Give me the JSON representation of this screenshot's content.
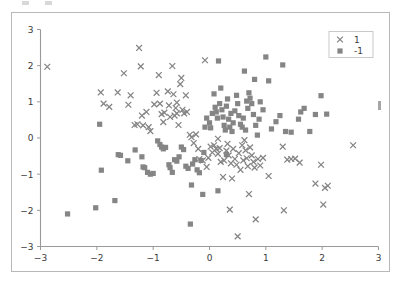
{
  "chart_data": {
    "type": "scatter",
    "title": "",
    "xlabel": "",
    "ylabel": "",
    "xlim": [
      -3,
      3
    ],
    "ylim": [
      -3,
      3
    ],
    "xticks": [
      -3,
      -2,
      -1,
      0,
      1,
      2,
      3
    ],
    "yticks": [
      -3,
      -2,
      -1,
      0,
      1,
      2,
      3
    ],
    "xtick_labels": [
      "−3",
      "−2",
      "−1",
      "0",
      "1",
      "2",
      "3"
    ],
    "ytick_labels": [
      "−3",
      "−2",
      "−1",
      "0",
      "1",
      "2",
      "3"
    ],
    "grid": false,
    "legend_position": "upper right",
    "marker_color": "#858585",
    "series": [
      {
        "name": "1",
        "marker": "x",
        "color": "#848484",
        "points": [
          [
            -2.88,
            1.97
          ],
          [
            -1.93,
            1.26
          ],
          [
            -1.88,
            0.95
          ],
          [
            -1.78,
            0.86
          ],
          [
            -1.63,
            1.26
          ],
          [
            -1.52,
            1.79
          ],
          [
            -1.44,
            0.92
          ],
          [
            -1.4,
            1.18
          ],
          [
            -1.33,
            0.36
          ],
          [
            -1.28,
            0.38
          ],
          [
            -1.25,
            2.49
          ],
          [
            -1.22,
            1.98
          ],
          [
            -1.2,
            0.62
          ],
          [
            -1.18,
            0.35
          ],
          [
            -1.12,
            0.72
          ],
          [
            -1.08,
            0.3
          ],
          [
            -1.05,
            0.19
          ],
          [
            -0.98,
            0.93
          ],
          [
            -0.94,
            1.25
          ],
          [
            -0.9,
            1.74
          ],
          [
            -0.88,
            0.95
          ],
          [
            -0.85,
            0.66
          ],
          [
            -0.82,
            0.44
          ],
          [
            -0.8,
            0.7
          ],
          [
            -0.74,
            1.29
          ],
          [
            -0.72,
            0.9
          ],
          [
            -0.7,
            0.58
          ],
          [
            -0.66,
            1.99
          ],
          [
            -0.64,
            1.21
          ],
          [
            -0.6,
            0.83
          ],
          [
            -0.58,
            0.68
          ],
          [
            -0.55,
            0.36
          ],
          [
            -0.52,
            1.49
          ],
          [
            -0.5,
            1.66
          ],
          [
            -0.48,
            0.78
          ],
          [
            -0.45,
            0.68
          ],
          [
            -0.42,
            1.18
          ],
          [
            -0.4,
            0.72
          ],
          [
            -0.35,
            0.09
          ],
          [
            -0.32,
            0.02
          ],
          [
            -0.28,
            -0.14
          ],
          [
            -0.24,
            0.1
          ],
          [
            -0.2,
            -0.3
          ],
          [
            -0.18,
            -0.58
          ],
          [
            -0.12,
            -0.62
          ],
          [
            -0.08,
            2.15
          ],
          [
            -0.05,
            -0.8
          ],
          [
            -0.02,
            -0.55
          ],
          [
            0.02,
            -0.24
          ],
          [
            0.05,
            -0.4
          ],
          [
            0.08,
            -0.2
          ],
          [
            0.12,
            -0.3
          ],
          [
            0.15,
            -0.44
          ],
          [
            0.18,
            -0.28
          ],
          [
            0.2,
            -0.66
          ],
          [
            0.24,
            -1.08
          ],
          [
            0.26,
            -0.62
          ],
          [
            0.3,
            -0.35
          ],
          [
            0.32,
            -0.16
          ],
          [
            0.34,
            -0.48
          ],
          [
            0.36,
            -1.98
          ],
          [
            0.38,
            -0.7
          ],
          [
            0.4,
            -1.12
          ],
          [
            0.42,
            -0.3
          ],
          [
            0.45,
            -0.58
          ],
          [
            0.48,
            -0.74
          ],
          [
            0.5,
            -2.72
          ],
          [
            0.52,
            -0.42
          ],
          [
            0.55,
            -0.88
          ],
          [
            0.58,
            -0.2
          ],
          [
            0.6,
            -0.62
          ],
          [
            0.62,
            -0.06
          ],
          [
            0.64,
            -0.34
          ],
          [
            0.66,
            -0.56
          ],
          [
            0.68,
            -0.78
          ],
          [
            0.7,
            -1.55
          ],
          [
            0.72,
            -0.26
          ],
          [
            0.75,
            -0.48
          ],
          [
            0.78,
            -0.66
          ],
          [
            0.8,
            -0.82
          ],
          [
            0.82,
            -2.25
          ],
          [
            0.86,
            -0.58
          ],
          [
            0.9,
            -0.76
          ],
          [
            0.95,
            -0.55
          ],
          [
            1.05,
            -1.05
          ],
          [
            1.3,
            -0.24
          ],
          [
            1.32,
            -2.0
          ],
          [
            1.38,
            -0.6
          ],
          [
            1.45,
            -0.58
          ],
          [
            1.52,
            -0.57
          ],
          [
            1.6,
            -0.68
          ],
          [
            1.88,
            -1.26
          ],
          [
            1.98,
            -0.74
          ],
          [
            2.05,
            -1.38
          ],
          [
            2.1,
            -1.32
          ],
          [
            2.02,
            -1.84
          ],
          [
            2.55,
            -0.2
          ],
          [
            -0.62,
            0.62
          ],
          [
            -0.58,
            0.98
          ],
          [
            0.15,
            -0.02
          ]
        ]
      },
      {
        "name": "-1",
        "marker": "s",
        "color": "#858585",
        "points": [
          [
            -2.52,
            -2.1
          ],
          [
            -2.02,
            -1.93
          ],
          [
            -1.95,
            0.38
          ],
          [
            -1.92,
            -0.89
          ],
          [
            -1.68,
            -1.73
          ],
          [
            -1.62,
            -0.46
          ],
          [
            -1.58,
            -0.48
          ],
          [
            -1.45,
            -0.63
          ],
          [
            -1.32,
            -0.33
          ],
          [
            -1.2,
            -0.52
          ],
          [
            -1.18,
            -0.8
          ],
          [
            -1.15,
            -0.82
          ],
          [
            -1.1,
            -0.95
          ],
          [
            -1.05,
            -1.0
          ],
          [
            -1.0,
            -0.98
          ],
          [
            -0.92,
            -0.08
          ],
          [
            -0.88,
            -0.18
          ],
          [
            -0.85,
            -0.25
          ],
          [
            -0.82,
            -0.3
          ],
          [
            -0.78,
            -0.26
          ],
          [
            -0.72,
            -0.74
          ],
          [
            -0.7,
            -0.82
          ],
          [
            -0.66,
            -0.95
          ],
          [
            -0.62,
            -0.6
          ],
          [
            -0.58,
            -0.64
          ],
          [
            -0.54,
            -0.52
          ],
          [
            -0.5,
            -0.25
          ],
          [
            -0.46,
            -0.32
          ],
          [
            -0.42,
            -0.78
          ],
          [
            -0.38,
            -0.84
          ],
          [
            -0.34,
            -2.38
          ],
          [
            -0.32,
            -1.3
          ],
          [
            -0.3,
            -0.72
          ],
          [
            -0.26,
            -0.6
          ],
          [
            -0.22,
            -0.88
          ],
          [
            -0.18,
            -0.96
          ],
          [
            -0.15,
            -0.62
          ],
          [
            -0.12,
            -1.56
          ],
          [
            -0.1,
            -0.4
          ],
          [
            -0.08,
            0.3
          ],
          [
            -0.05,
            0.55
          ],
          [
            0.0,
            0.42
          ],
          [
            0.02,
            0.28
          ],
          [
            0.05,
            0.68
          ],
          [
            0.08,
            1.22
          ],
          [
            0.1,
            0.85
          ],
          [
            0.12,
            0.72
          ],
          [
            0.14,
            0.55
          ],
          [
            0.15,
            -1.46
          ],
          [
            0.16,
            2.13
          ],
          [
            0.18,
            0.95
          ],
          [
            0.2,
            1.38
          ],
          [
            0.22,
            0.78
          ],
          [
            0.24,
            0.58
          ],
          [
            0.26,
            0.35
          ],
          [
            0.28,
            0.22
          ],
          [
            0.3,
            0.88
          ],
          [
            0.32,
            1.08
          ],
          [
            0.34,
            0.52
          ],
          [
            0.36,
            0.3
          ],
          [
            0.38,
            0.68
          ],
          [
            0.4,
            0.18
          ],
          [
            0.42,
            0.42
          ],
          [
            0.45,
            0.75
          ],
          [
            0.48,
            1.18
          ],
          [
            0.5,
            0.95
          ],
          [
            0.52,
            0.62
          ],
          [
            0.55,
            0.38
          ],
          [
            0.58,
            0.3
          ],
          [
            0.6,
            0.55
          ],
          [
            0.62,
            1.85
          ],
          [
            0.64,
            0.22
          ],
          [
            0.66,
            1.02
          ],
          [
            0.68,
            0.82
          ],
          [
            0.7,
            1.25
          ],
          [
            0.72,
            1.1
          ],
          [
            0.75,
            0.95
          ],
          [
            0.78,
            0.65
          ],
          [
            0.8,
            1.62
          ],
          [
            0.82,
            0.35
          ],
          [
            0.85,
            0.08
          ],
          [
            0.88,
            0.52
          ],
          [
            0.9,
            1.0
          ],
          [
            0.95,
            0.78
          ],
          [
            1.0,
            2.24
          ],
          [
            1.05,
            1.58
          ],
          [
            1.1,
            0.25
          ],
          [
            1.18,
            0.45
          ],
          [
            1.25,
            0.62
          ],
          [
            1.3,
            2.02
          ],
          [
            1.35,
            0.18
          ],
          [
            1.45,
            0.16
          ],
          [
            1.58,
            0.52
          ],
          [
            1.62,
            0.72
          ],
          [
            1.68,
            0.82
          ],
          [
            1.78,
            0.18
          ],
          [
            1.88,
            0.65
          ],
          [
            1.98,
            1.17
          ],
          [
            2.08,
            0.66
          ],
          [
            0.3,
            -0.46
          ]
        ]
      }
    ]
  },
  "legend": {
    "entries": [
      {
        "label": "1",
        "marker": "x-marker"
      },
      {
        "label": "-1",
        "marker": "square-marker"
      }
    ]
  }
}
